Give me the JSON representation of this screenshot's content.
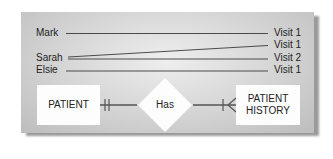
{
  "patients": [
    {
      "name": "Mark",
      "y": 33
    },
    {
      "name": "Sarah",
      "y": 58
    },
    {
      "name": "Elsie",
      "y": 70
    }
  ],
  "visits": [
    {
      "label": "Visit 1",
      "y": 33
    },
    {
      "label": "Visit 1",
      "y": 45
    },
    {
      "label": "Visit 2",
      "y": 58
    },
    {
      "label": "Visit 1",
      "y": 70
    }
  ],
  "links": [
    {
      "from": "Mark",
      "to_index": 0
    },
    {
      "from": "Sarah",
      "to_index": 1
    },
    {
      "from": "Sarah",
      "to_index": 2
    },
    {
      "from": "Elsie",
      "to_index": 3
    }
  ],
  "erd": {
    "entity_left": "PATIENT",
    "relationship": "Has",
    "entity_right_line1": "PATIENT",
    "entity_right_line2": "HISTORY",
    "left_cardinality": "one-and-only-one",
    "right_cardinality": "one-or-many"
  },
  "colors": {
    "line": "#3a3a3a",
    "connector": "#555555",
    "box": "#fdfdfd"
  }
}
